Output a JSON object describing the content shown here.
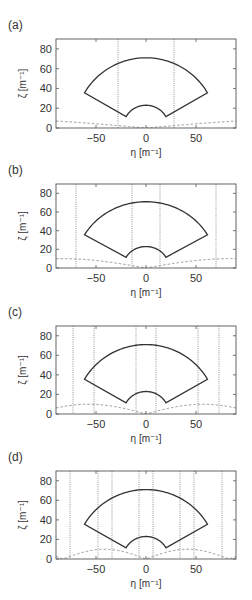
{
  "figure": {
    "xlabel": "η [m⁻¹]",
    "ylabel": "ζ [m⁻¹]",
    "xticks": [
      -50,
      0,
      50
    ],
    "yticks": [
      0,
      20,
      40,
      60,
      80
    ],
    "xlim": [
      -90,
      90
    ],
    "ylim": [
      0,
      90
    ]
  },
  "chart_data": [
    {
      "type": "line",
      "panel": "(a)",
      "title": "(a)",
      "xlabel": "η [m⁻¹]",
      "ylabel": "ζ [m⁻¹]",
      "xlim": [
        -90,
        90
      ],
      "ylim": [
        0,
        90
      ],
      "xticks": [
        -50,
        0,
        50
      ],
      "yticks": [
        0,
        20,
        40,
        60,
        80
      ],
      "grid": false,
      "fan_region": {
        "inner_radius": 23,
        "outer_radius": 71,
        "angle_deg": [
          30,
          150
        ],
        "corners": [
          [
            -62,
            36
          ],
          [
            62,
            36
          ],
          [
            -21,
            12
          ],
          [
            21,
            12
          ]
        ]
      },
      "dotted_vertical_lines": [
        -28,
        28
      ],
      "dashed_curve": {
        "description": "|sin| bump curve",
        "x": [
          -90,
          -45,
          0,
          45,
          90
        ],
        "y": [
          10,
          7,
          0,
          7,
          10
        ]
      }
    },
    {
      "type": "line",
      "panel": "(b)",
      "title": "(b)",
      "xlabel": "",
      "ylabel": "ζ [m⁻¹]",
      "xlim": [
        -90,
        90
      ],
      "ylim": [
        0,
        90
      ],
      "xticks": [
        -50,
        0,
        50
      ],
      "yticks": [
        0,
        20,
        40,
        60,
        80
      ],
      "grid": false,
      "fan_region": {
        "inner_radius": 23,
        "outer_radius": 71,
        "angle_deg": [
          30,
          150
        ],
        "corners": [
          [
            -62,
            36
          ],
          [
            62,
            36
          ],
          [
            -21,
            12
          ],
          [
            21,
            12
          ]
        ]
      },
      "dotted_vertical_lines": [
        -70,
        -14,
        14,
        70
      ],
      "dashed_curve": {
        "description": "|sin| bump curve",
        "x": [
          -85,
          -42,
          0,
          42,
          85
        ],
        "y": [
          0,
          10,
          0,
          10,
          0
        ]
      }
    },
    {
      "type": "line",
      "panel": "(c)",
      "title": "(c)",
      "xlabel": "η [m⁻¹]",
      "ylabel": "ζ [m⁻¹]",
      "xlim": [
        -90,
        90
      ],
      "ylim": [
        0,
        90
      ],
      "xticks": [
        -50,
        0,
        50
      ],
      "yticks": [
        0,
        20,
        40,
        60,
        80
      ],
      "grid": false,
      "fan_region": {
        "inner_radius": 23,
        "outer_radius": 71,
        "angle_deg": [
          30,
          150
        ],
        "corners": [
          [
            -62,
            36
          ],
          [
            62,
            36
          ],
          [
            -21,
            12
          ],
          [
            21,
            12
          ]
        ]
      },
      "dotted_vertical_lines": [
        -73,
        -52,
        -10,
        10,
        52,
        73
      ],
      "dashed_curve": {
        "description": "|sin| bump curve",
        "x": [
          -90,
          -57,
          -28.5,
          0,
          28.5,
          57,
          90
        ],
        "y": [
          10,
          0,
          10,
          0,
          10,
          0,
          10
        ]
      }
    },
    {
      "type": "line",
      "panel": "(d)",
      "title": "(d)",
      "xlabel": "η [m⁻¹]",
      "ylabel": "ζ [m⁻¹]",
      "xlim": [
        -90,
        90
      ],
      "ylim": [
        0,
        90
      ],
      "xticks": [
        -50,
        0,
        50
      ],
      "yticks": [
        0,
        20,
        40,
        60,
        80
      ],
      "grid": false,
      "fan_region": {
        "inner_radius": 23,
        "outer_radius": 71,
        "angle_deg": [
          30,
          150
        ],
        "corners": [
          [
            -62,
            36
          ],
          [
            62,
            36
          ],
          [
            -21,
            12
          ],
          [
            21,
            12
          ]
        ]
      },
      "dotted_vertical_lines": [
        -76,
        -48,
        -34,
        -7,
        7,
        34,
        48,
        76
      ],
      "dashed_curve": {
        "description": "|sin| bump curve",
        "x": [
          -83,
          -62,
          -41.5,
          -21,
          0,
          21,
          41.5,
          62,
          83
        ],
        "y": [
          0,
          10,
          0,
          10,
          0,
          10,
          0,
          10,
          0
        ]
      }
    }
  ],
  "panels": [
    {
      "label": "(a)",
      "top": 39,
      "height": 89,
      "show_xlabel": true,
      "dotted": [
        -28,
        28
      ],
      "period": 180,
      "phase": 0
    },
    {
      "label": "(b)",
      "top": 184,
      "height": 84,
      "show_xlabel": true,
      "dotted": [
        -70,
        -14,
        14,
        70
      ],
      "period": 84,
      "phase": 0
    },
    {
      "label": "(c)",
      "top": 326,
      "height": 88,
      "show_xlabel": true,
      "dotted": [
        -73,
        -52,
        -10,
        10,
        52,
        73
      ],
      "period": 57,
      "phase": 0
    },
    {
      "label": "(d)",
      "top": 471,
      "height": 88,
      "show_xlabel": true,
      "dotted": [
        -76,
        -48,
        -34,
        -7,
        7,
        34,
        48,
        76
      ],
      "period": 41.5,
      "phase": 0
    }
  ]
}
